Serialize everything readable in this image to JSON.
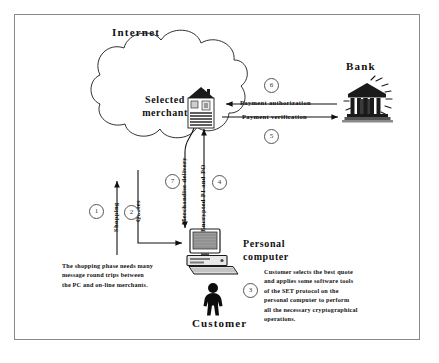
{
  "diagram": {
    "frame": {
      "border_color": "#8a8a8a",
      "background": "#ffffff"
    }
  },
  "nodes": {
    "internet": {
      "label": "Internet",
      "icon": "cloud-icon"
    },
    "merchant": {
      "label": "Selected\nmerchant",
      "label_line1": "Selected",
      "label_line2": "merchant",
      "icon": "storefront-icon"
    },
    "bank": {
      "label": "Bank",
      "icon": "bank-building-icon"
    },
    "personal_computer": {
      "label_line1": "Personal",
      "label_line2": "computer",
      "icon": "desktop-computer-icon"
    },
    "customer": {
      "label": "Customer",
      "icon": "person-icon"
    }
  },
  "edges": [
    {
      "id": "shopping",
      "label": "Shopping",
      "step": "1",
      "direction": "pc-to-internet",
      "orientation": "vertical"
    },
    {
      "id": "quotes",
      "label": "Quotes",
      "step": "2",
      "direction": "internet-to-pc",
      "orientation": "vertical"
    },
    {
      "id": "encrypted",
      "label": "Encrypted PI and PO",
      "step": "4",
      "direction": "pc-to-merchant",
      "orientation": "vertical"
    },
    {
      "id": "merchandise",
      "label": "Merchandise delivery",
      "step": "7",
      "direction": "merchant-to-pc",
      "orientation": "vertical"
    },
    {
      "id": "payment_authorization",
      "label": "Payment authorization",
      "step": "6",
      "direction": "bank-to-merchant",
      "orientation": "horizontal"
    },
    {
      "id": "payment_verification",
      "label": "Payment verification",
      "step": "5",
      "direction": "merchant-to-bank",
      "orientation": "horizontal"
    }
  ],
  "steps": {
    "one": "1",
    "two": "2",
    "three": "3",
    "four": "4",
    "five": "5",
    "six": "6",
    "seven": "7"
  },
  "notes": {
    "shopping_note": {
      "lines": [
        "The shopping phase needs many",
        "message round trips between",
        "the PC and on-line merchants."
      ],
      "line1": "The shopping phase needs many",
      "line2": "message round trips between",
      "line3": "the PC and on-line merchants."
    },
    "set_note": {
      "lines": [
        "Customer selects the best quote",
        "and applies some software tools",
        "of the SET protocol on the",
        "personal computer to perform",
        "all the necessary cryptographical",
        "operations."
      ],
      "line1": "Customer selects the best quote",
      "line2": "and applies some software tools",
      "line3": "of the SET protocol on the",
      "line4": "personal computer to perform",
      "line5": "all the necessary cryptographical",
      "line6": "operations."
    }
  },
  "colors": {
    "ink": "#111111",
    "frame": "#8a8a8a",
    "line": "#222222",
    "step_circle": "#555555"
  }
}
